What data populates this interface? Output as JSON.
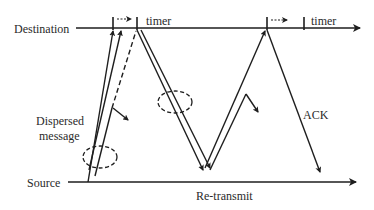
{
  "diagram": {
    "type": "timing-sequence",
    "labels": {
      "destination": "Destination",
      "source": "Source",
      "timer_1": "timer",
      "timer_2": "timer",
      "dispersed_line1": "Dispersed",
      "dispersed_line2": "message",
      "ack": "ACK",
      "retransmit": "Re-transmit"
    },
    "colors": {
      "line": "#1e1e1e",
      "text": "#2a2a2a",
      "background": "#ffffff"
    }
  }
}
